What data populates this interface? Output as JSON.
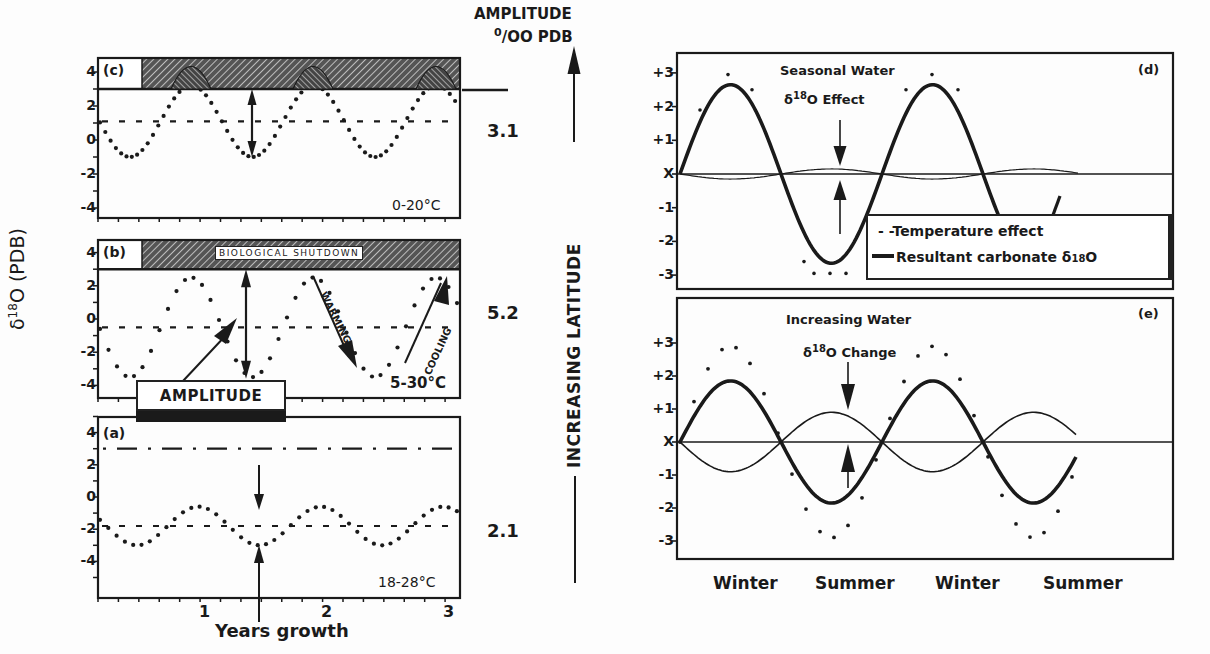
{
  "figure": {
    "left_group": {
      "y_axis_label": "δ18O (PDB)",
      "y_axis_label_main": "δ",
      "y_axis_label_sup": "18",
      "y_axis_label_rest": "O (PDB)",
      "x_axis_label": "Years growth",
      "x_ticks": [
        "1",
        "2",
        "3"
      ],
      "y_ticks": [
        "4",
        "2",
        "0",
        "-2",
        "-4"
      ],
      "amplitude_header_line1": "AMPLITUDE",
      "amplitude_header_line2_sup": "0",
      "amplitude_header_line2": "/OO PDB",
      "latitude_label": "INCREASING LATITUDE",
      "amplitude_box_label": "AMPLITUDE",
      "panels": [
        {
          "id": "c",
          "tag": "(c)",
          "temp_range": "0-20°C",
          "amplitude": "3.1"
        },
        {
          "id": "b",
          "tag": "(b)",
          "temp_range": "5-30°C",
          "amplitude": "5.2",
          "shutdown_label": "BIOLOGICAL SHUTDOWN",
          "warming_label": "WARMING",
          "cooling_label": "COOLING"
        },
        {
          "id": "a",
          "tag": "(a)",
          "temp_range": "18-28°C",
          "amplitude": "2.1"
        }
      ]
    },
    "right_group": {
      "y_ticks": [
        "+3",
        "+2",
        "+1",
        "X",
        "-1",
        "-2",
        "-3"
      ],
      "x_labels": [
        "Winter",
        "Summer",
        "Winter",
        "Summer"
      ],
      "panels": [
        {
          "id": "d",
          "tag": "(d)",
          "annotation_line1": "Seasonal Water",
          "annotation_sup": "18",
          "annotation_line2_pre": "δ",
          "annotation_line2_post": "O Effect"
        },
        {
          "id": "e",
          "tag": "(e)",
          "annotation_line1": "Increasing Water",
          "annotation_sup": "18",
          "annotation_line2_pre": "δ",
          "annotation_line2_post": "O Change"
        }
      ],
      "legend": {
        "temperature": "- -Temperature effect",
        "resultant": "Resultant carbonate δ",
        "resultant_sup": "18",
        "resultant_post": "O"
      }
    }
  },
  "chart_data": [
    {
      "type": "line",
      "panel": "(c)",
      "title": "0-20°C",
      "xlabel": "Years growth",
      "ylabel": "δ18O (PDB)",
      "xlim": [
        0,
        3
      ],
      "ylim": [
        -5,
        5
      ],
      "series": [
        {
          "name": "carbonate δ18O (dotted)",
          "mean": 1.1,
          "min": -1.0,
          "max": 3.0,
          "clipped_above": 3.0,
          "minima_years": [
            0.4,
            1.4,
            2.4
          ]
        },
        {
          "name": "mean (dashed)",
          "value": 1.1
        },
        {
          "name": "biological shutdown zone (hatched)",
          "from": 3.0,
          "to": 5.0
        }
      ],
      "amplitude": 3.1
    },
    {
      "type": "line",
      "panel": "(b)",
      "title": "5-30°C",
      "xlabel": "Years growth",
      "ylabel": "δ18O (PDB)",
      "xlim": [
        0,
        3
      ],
      "ylim": [
        -5,
        5
      ],
      "series": [
        {
          "name": "carbonate δ18O (dotted)",
          "mean": -0.5,
          "min": -3.5,
          "max": 3.0,
          "clipped_above": 3.0,
          "minima_years": [
            0.4,
            1.4,
            2.4
          ]
        },
        {
          "name": "mean (dashed)",
          "value": -0.5
        },
        {
          "name": "biological shutdown zone (hatched)",
          "from": 3.0,
          "to": 5.0
        }
      ],
      "annotations": [
        "BIOLOGICAL SHUTDOWN",
        "WARMING",
        "COOLING",
        "AMPLITUDE"
      ],
      "amplitude": 5.2
    },
    {
      "type": "line",
      "panel": "(a)",
      "title": "18-28°C",
      "xlabel": "Years growth",
      "ylabel": "δ18O (PDB)",
      "xlim": [
        0,
        3
      ],
      "ylim": [
        -5,
        5
      ],
      "series": [
        {
          "name": "carbonate δ18O (dotted)",
          "mean": -1.9,
          "min": -3.0,
          "max": -0.6,
          "minima_years": [
            0.5,
            1.45,
            2.45
          ],
          "maxima_years": [
            0.95,
            1.95,
            2.95
          ]
        },
        {
          "name": "mean (dashed)",
          "value": -1.9
        },
        {
          "name": "shutdown threshold (dash-dot)",
          "value": 3.0
        }
      ],
      "amplitude": 2.1
    },
    {
      "type": "line",
      "panel": "(d)",
      "title": "Seasonal Water δ18O Effect",
      "x": [
        "Winter",
        "Summer",
        "Winter",
        "Summer"
      ],
      "ylim": [
        -3,
        3
      ],
      "yticks": [
        "+3",
        "+2",
        "+1",
        "X",
        "-1",
        "-2",
        "-3"
      ],
      "series": [
        {
          "name": "Temperature effect",
          "style": "dashed",
          "amplitude": 2.8
        },
        {
          "name": "Resultant carbonate δ18O",
          "style": "solid-thick",
          "amplitude": 2.65
        },
        {
          "name": "Water δ18O",
          "style": "thin",
          "amplitude": 0.15,
          "phase": "opposite"
        }
      ]
    },
    {
      "type": "line",
      "panel": "(e)",
      "title": "Increasing Water δ18O Change",
      "x": [
        "Winter",
        "Summer",
        "Winter",
        "Summer"
      ],
      "ylim": [
        -3,
        3
      ],
      "yticks": [
        "+3",
        "+2",
        "+1",
        "X",
        "-1",
        "-2",
        "-3"
      ],
      "series": [
        {
          "name": "Temperature effect",
          "style": "dotted",
          "amplitude": 2.9
        },
        {
          "name": "Resultant carbonate δ18O",
          "style": "solid-thick",
          "amplitude": 1.85
        },
        {
          "name": "Water δ18O",
          "style": "thin",
          "amplitude": 0.9,
          "phase": "opposite"
        }
      ]
    }
  ]
}
